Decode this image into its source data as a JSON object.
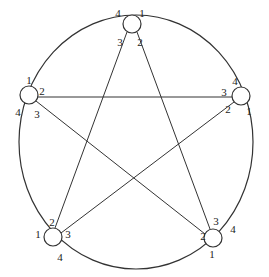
{
  "diagram": {
    "type": "ring-star network",
    "outer_ring": {
      "cx": 136,
      "cy": 142,
      "rx": 117,
      "ry": 127
    },
    "node_radius": 9,
    "nodes": [
      {
        "id": "top",
        "cx": 132,
        "cy": 24,
        "ports": [
          {
            "label": "4",
            "x": 118,
            "y": 14
          },
          {
            "label": "1",
            "x": 142,
            "y": 14
          },
          {
            "label": "3",
            "x": 120,
            "y": 43
          },
          {
            "label": "2",
            "x": 140,
            "y": 43
          }
        ]
      },
      {
        "id": "left",
        "cx": 29,
        "cy": 95,
        "ports": [
          {
            "label": "1",
            "x": 29,
            "y": 81
          },
          {
            "label": "2",
            "x": 42,
            "y": 92
          },
          {
            "label": "4",
            "x": 18,
            "y": 113
          },
          {
            "label": "3",
            "x": 37,
            "y": 115
          }
        ]
      },
      {
        "id": "right",
        "cx": 241,
        "cy": 96,
        "ports": [
          {
            "label": "4",
            "x": 235,
            "y": 82
          },
          {
            "label": "3",
            "x": 224,
            "y": 93
          },
          {
            "label": "2",
            "x": 228,
            "y": 110
          },
          {
            "label": "1",
            "x": 249,
            "y": 112
          }
        ]
      },
      {
        "id": "bottom-left",
        "cx": 53,
        "cy": 237,
        "ports": [
          {
            "label": "2",
            "x": 52,
            "y": 223
          },
          {
            "label": "1",
            "x": 38,
            "y": 235
          },
          {
            "label": "3",
            "x": 68,
            "y": 235
          },
          {
            "label": "4",
            "x": 60,
            "y": 258
          }
        ]
      },
      {
        "id": "bottom-right",
        "cx": 213,
        "cy": 238,
        "ports": [
          {
            "label": "3",
            "x": 216,
            "y": 222
          },
          {
            "label": "2",
            "x": 203,
            "y": 237
          },
          {
            "label": "4",
            "x": 233,
            "y": 230
          },
          {
            "label": "1",
            "x": 212,
            "y": 255
          }
        ]
      }
    ],
    "edges": [
      {
        "from": "top",
        "from_port": "3",
        "to": "bottom-left",
        "to_port": "2",
        "x1": 127,
        "y1": 32,
        "x2": 55,
        "y2": 228
      },
      {
        "from": "top",
        "from_port": "2",
        "to": "bottom-right",
        "to_port": "3",
        "x1": 137,
        "y1": 32,
        "x2": 210,
        "y2": 229
      },
      {
        "from": "left",
        "from_port": "2",
        "to": "right",
        "to_port": "3",
        "x1": 38,
        "y1": 97,
        "x2": 232,
        "y2": 97
      },
      {
        "from": "left",
        "from_port": "3",
        "to": "bottom-right",
        "to_port": "2",
        "x1": 36,
        "y1": 101,
        "x2": 205,
        "y2": 234
      },
      {
        "from": "bottom-left",
        "from_port": "3",
        "to": "right",
        "to_port": "2",
        "x1": 61,
        "y1": 233,
        "x2": 234,
        "y2": 102
      }
    ]
  }
}
